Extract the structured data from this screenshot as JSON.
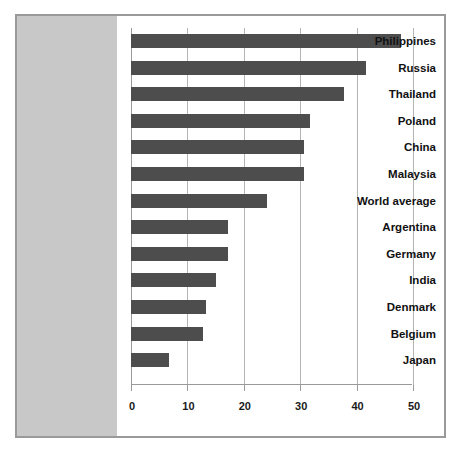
{
  "chart_data": {
    "type": "bar",
    "orientation": "horizontal",
    "title": "",
    "subtitle": "",
    "xlabel": "",
    "ylabel": "",
    "xlim": [
      0,
      50
    ],
    "xticks": [
      0,
      10,
      20,
      30,
      40,
      50
    ],
    "xtick_labels": [
      "0",
      "10",
      "20",
      "30",
      "40",
      "50"
    ],
    "grid": "vertical",
    "legend": "none",
    "categories": [
      "Philippines",
      "Russia",
      "Thailand",
      "Poland",
      "China",
      "Malaysia",
      "World average",
      "Argentina",
      "Germany",
      "India",
      "Denmark",
      "Belgium",
      "Japan"
    ],
    "values": [
      47.8,
      41.7,
      37.8,
      31.8,
      30.7,
      30.7,
      24.2,
      17.2,
      17.2,
      15.1,
      13.3,
      12.7,
      6.8
    ],
    "bar_color": "#4d4d4d",
    "label_panel_color": "#c8c8c8",
    "gridline_color": "#b4b4b4",
    "axis_color": "#9a9a9a",
    "border_color": "#9a9a9a",
    "background_color": "#ffffff"
  }
}
